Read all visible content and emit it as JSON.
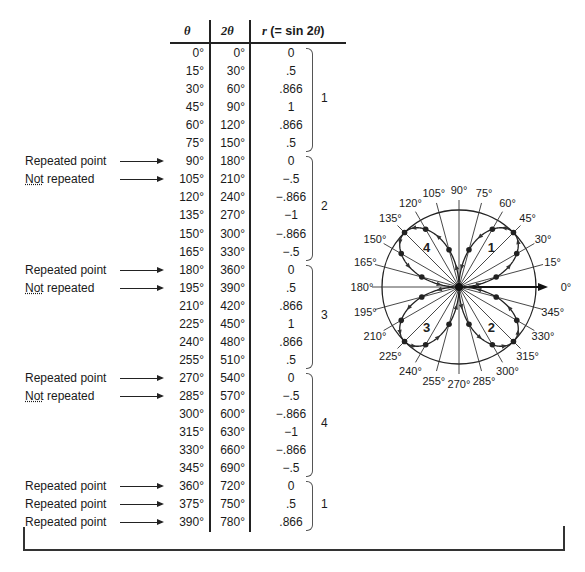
{
  "table": {
    "headers": {
      "theta": "θ",
      "two_theta": "2θ",
      "r": "r (= sin 2θ)"
    },
    "rows": [
      {
        "theta": "0°",
        "two_theta": "0°",
        "r": "0",
        "label": ""
      },
      {
        "theta": "15°",
        "two_theta": "30°",
        "r": ".5",
        "label": ""
      },
      {
        "theta": "30°",
        "two_theta": "60°",
        "r": ".866",
        "label": ""
      },
      {
        "theta": "45°",
        "two_theta": "90°",
        "r": "1",
        "label": ""
      },
      {
        "theta": "60°",
        "two_theta": "120°",
        "r": ".866",
        "label": ""
      },
      {
        "theta": "75°",
        "two_theta": "150°",
        "r": ".5",
        "label": ""
      },
      {
        "theta": "90°",
        "two_theta": "180°",
        "r": "0",
        "label": "Repeated point"
      },
      {
        "theta": "105°",
        "two_theta": "210°",
        "r": "−.5",
        "label": "Not repeated"
      },
      {
        "theta": "120°",
        "two_theta": "240°",
        "r": "−.866",
        "label": ""
      },
      {
        "theta": "135°",
        "two_theta": "270°",
        "r": "−1",
        "label": ""
      },
      {
        "theta": "150°",
        "two_theta": "300°",
        "r": "−.866",
        "label": ""
      },
      {
        "theta": "165°",
        "two_theta": "330°",
        "r": "−.5",
        "label": ""
      },
      {
        "theta": "180°",
        "two_theta": "360°",
        "r": "0",
        "label": "Repeated point"
      },
      {
        "theta": "195°",
        "two_theta": "390°",
        "r": ".5",
        "label": "Not repeated"
      },
      {
        "theta": "210°",
        "two_theta": "420°",
        "r": ".866",
        "label": ""
      },
      {
        "theta": "225°",
        "two_theta": "450°",
        "r": "1",
        "label": ""
      },
      {
        "theta": "240°",
        "two_theta": "480°",
        "r": ".866",
        "label": ""
      },
      {
        "theta": "255°",
        "two_theta": "510°",
        "r": ".5",
        "label": ""
      },
      {
        "theta": "270°",
        "two_theta": "540°",
        "r": "0",
        "label": "Repeated point"
      },
      {
        "theta": "285°",
        "two_theta": "570°",
        "r": "−.5",
        "label": "Not repeated"
      },
      {
        "theta": "300°",
        "two_theta": "600°",
        "r": "−.866",
        "label": ""
      },
      {
        "theta": "315°",
        "two_theta": "630°",
        "r": "−1",
        "label": ""
      },
      {
        "theta": "330°",
        "two_theta": "660°",
        "r": "−.866",
        "label": ""
      },
      {
        "theta": "345°",
        "two_theta": "690°",
        "r": "−.5",
        "label": ""
      },
      {
        "theta": "360°",
        "two_theta": "720°",
        "r": "0",
        "label": "Repeated point"
      },
      {
        "theta": "375°",
        "two_theta": "750°",
        "r": ".5",
        "label": "Repeated point"
      },
      {
        "theta": "390°",
        "two_theta": "780°",
        "r": ".866",
        "label": "Repeated point"
      }
    ],
    "braces": [
      {
        "label": "1",
        "from_row": 0,
        "to_row": 5
      },
      {
        "label": "2",
        "from_row": 6,
        "to_row": 11
      },
      {
        "label": "3",
        "from_row": 12,
        "to_row": 17
      },
      {
        "label": "4",
        "from_row": 18,
        "to_row": 23
      },
      {
        "label": "1",
        "from_row": 24,
        "to_row": 26
      }
    ]
  },
  "polar_plot": {
    "equation": "r = sin 2θ",
    "angle_labels": [
      "0°",
      "15°",
      "30°",
      "45°",
      "60°",
      "75°",
      "90°",
      "105°",
      "120°",
      "135°",
      "150°",
      "165°",
      "180°",
      "195°",
      "210°",
      "225°",
      "240°",
      "255°",
      "270°",
      "285°",
      "300°",
      "315°",
      "330°",
      "345°"
    ],
    "petal_labels": [
      {
        "label": "1",
        "angle_deg": 45
      },
      {
        "label": "2",
        "angle_deg": 315
      },
      {
        "label": "3",
        "angle_deg": 225
      },
      {
        "label": "4",
        "angle_deg": 135
      }
    ]
  }
}
